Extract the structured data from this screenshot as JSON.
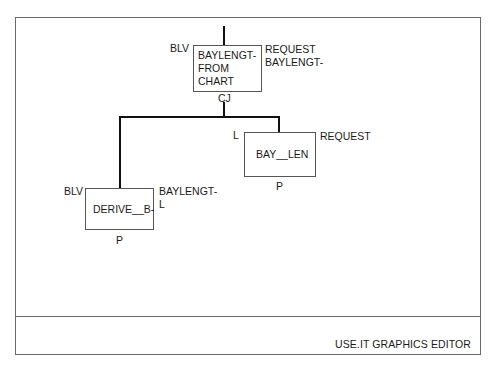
{
  "footer": {
    "title": "USE.IT GRAPHICS EDITOR"
  },
  "diagram": {
    "nodes": [
      {
        "id": "top",
        "lines": [
          "BAYLENGT-",
          "FROM",
          "CHART"
        ],
        "left_label": "BLV",
        "right_labels": [
          "REQUEST",
          "BAYLENGT-"
        ],
        "bottom_label": "CJ"
      },
      {
        "id": "right",
        "lines": [
          "BAY__LEN"
        ],
        "left_label": "L",
        "right_labels": [
          "REQUEST"
        ],
        "bottom_label": "P"
      },
      {
        "id": "left",
        "lines": [
          "DERIVE__B-"
        ],
        "left_label": "BLV",
        "right_labels": [
          "BAYLENGT-",
          "L"
        ],
        "bottom_label": "P"
      }
    ]
  }
}
